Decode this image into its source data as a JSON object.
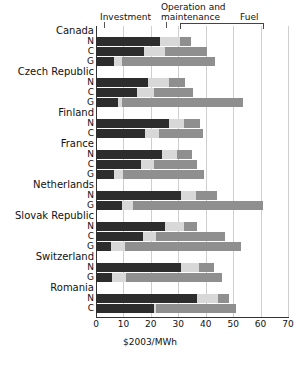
{
  "chart_data": {
    "type": "bar",
    "orientation": "horizontal",
    "stacked": true,
    "title": "",
    "xlabel": "$2003/MWh",
    "ylabel": "",
    "xlim": [
      0,
      70
    ],
    "xticks": [
      0,
      10,
      20,
      30,
      40,
      50,
      60,
      70
    ],
    "grid": true,
    "legend_position": "top",
    "series": [
      {
        "name": "Investment",
        "color": "#2d2d2d"
      },
      {
        "name": "Operation and maintenance",
        "color": "#d8d8d8"
      },
      {
        "name": "Fuel",
        "color": "#8f8f8f"
      }
    ],
    "category_codes": {
      "N": "Nuclear",
      "C": "Coal",
      "G": "Gas"
    },
    "groups": [
      {
        "country": "Canada",
        "rows": [
          {
            "code": "N",
            "investment": 23.5,
            "om": 7.3,
            "fuel": 3.7,
            "total": 34.5
          },
          {
            "code": "C",
            "investment": 17.4,
            "om": 7.9,
            "fuel": 15.2,
            "total": 40.5
          },
          {
            "code": "G",
            "investment": 6.5,
            "om": 3.0,
            "fuel": 34.0,
            "total": 43.5
          }
        ]
      },
      {
        "country": "Czech Republic",
        "rows": [
          {
            "code": "N",
            "investment": 19.0,
            "om": 7.5,
            "fuel": 6.0,
            "total": 32.5
          },
          {
            "code": "C",
            "investment": 15.0,
            "om": 6.0,
            "fuel": 14.5,
            "total": 35.5
          },
          {
            "code": "G",
            "investment": 8.0,
            "om": 1.5,
            "fuel": 44.0,
            "total": 53.5
          }
        ]
      },
      {
        "country": "Finland",
        "rows": [
          {
            "code": "N",
            "investment": 26.5,
            "om": 5.5,
            "fuel": 6.0,
            "total": 38.0
          },
          {
            "code": "C",
            "investment": 18.0,
            "om": 5.0,
            "fuel": 16.0,
            "total": 39.0
          }
        ]
      },
      {
        "country": "France",
        "rows": [
          {
            "code": "N",
            "investment": 24.0,
            "om": 5.5,
            "fuel": 5.5,
            "total": 35.0
          },
          {
            "code": "C",
            "investment": 16.5,
            "om": 4.5,
            "fuel": 16.0,
            "total": 37.0
          },
          {
            "code": "G",
            "investment": 6.5,
            "om": 3.5,
            "fuel": 29.5,
            "total": 39.5
          }
        ]
      },
      {
        "country": "Netherlands",
        "rows": [
          {
            "code": "N",
            "investment": 31.0,
            "om": 5.5,
            "fuel": 7.5,
            "total": 44.0
          },
          {
            "code": "G",
            "investment": 9.5,
            "om": 4.0,
            "fuel": 47.5,
            "total": 61.0
          }
        ]
      },
      {
        "country": "Slovak Republic",
        "rows": [
          {
            "code": "N",
            "investment": 25.0,
            "om": 7.0,
            "fuel": 5.0,
            "total": 37.0
          },
          {
            "code": "C",
            "investment": 17.0,
            "om": 5.0,
            "fuel": 25.0,
            "total": 47.0
          },
          {
            "code": "G",
            "investment": 5.5,
            "om": 5.0,
            "fuel": 42.5,
            "total": 53.0
          }
        ]
      },
      {
        "country": "Switzerland",
        "rows": [
          {
            "code": "N",
            "investment": 31.0,
            "om": 6.5,
            "fuel": 5.5,
            "total": 43.0
          },
          {
            "code": "G",
            "investment": 6.0,
            "om": 5.0,
            "fuel": 35.0,
            "total": 46.0
          }
        ]
      },
      {
        "country": "Romania",
        "rows": [
          {
            "code": "N",
            "investment": 37.0,
            "om": 7.5,
            "fuel": 4.0,
            "total": 48.5
          },
          {
            "code": "C",
            "investment": 21.0,
            "om": 1.0,
            "fuel": 29.0,
            "total": 51.0
          }
        ]
      }
    ]
  },
  "legend": {
    "investment": "Investment",
    "om_line1": "Operation and",
    "om_line2": "maintenance",
    "fuel": "Fuel"
  },
  "axis": {
    "title": "$2003/MWh",
    "ticks": [
      "0",
      "10",
      "20",
      "30",
      "40",
      "50",
      "60",
      "70"
    ]
  }
}
